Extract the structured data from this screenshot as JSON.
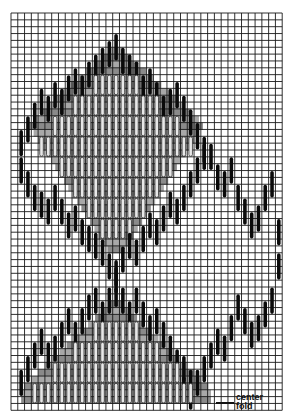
{
  "diagram": {
    "type": "needlepoint-bargello-chart",
    "grid": {
      "cols": 40,
      "rows": 58,
      "left": 11,
      "top": 13,
      "cell_w": 6.78,
      "cell_h": 6.85,
      "line_color": "#1a1a1a"
    },
    "colors": {
      "outline": "#0a0a0a",
      "shade_dark": "#8a8a8a",
      "shade_mid": "#a8a8a8",
      "stitch_light": "#e8e8e8",
      "background": "#ffffff"
    },
    "motifs": [
      {
        "name": "upper-carnation",
        "center_col": 14,
        "top_row": 3,
        "half_width": 13,
        "bottom_row": 38
      },
      {
        "name": "lower-carnation",
        "center_col": 14,
        "top_row": 39,
        "half_width": 13,
        "bottom_row": 58
      },
      {
        "name": "stem-curve",
        "description": "outline stitches descending right then rising"
      }
    ],
    "annotations": {
      "center_label": "center",
      "fold_label": "fold",
      "caption": ""
    }
  }
}
